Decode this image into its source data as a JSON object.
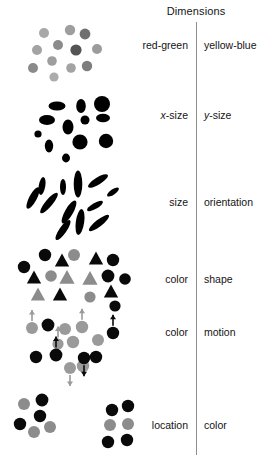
{
  "figure": {
    "title": "Dimensions",
    "width": 264,
    "height": 468,
    "background": "#ffffff",
    "divider_color": "#8f8f8f",
    "text_color": "#141414"
  },
  "rows": [
    {
      "id": "row-color-opponent",
      "left_label": "red-green",
      "right_label": "yellow-blue",
      "label_y": 39,
      "stimulus": "gray-circles-varying-lightness",
      "colors_used": [
        "#9a9a9a",
        "#b4b4b4",
        "#808080",
        "#6e6e6e",
        "#c3c3c3"
      ]
    },
    {
      "id": "row-size-xy",
      "left_label": "x-size",
      "right_label": "y-size",
      "left_label_italic_prefix": "x",
      "right_label_italic_prefix": "y",
      "label_y": 109,
      "stimulus": "black-ellipses-varying-width-height",
      "colors_used": [
        "#000000"
      ]
    },
    {
      "id": "row-size-orientation",
      "left_label": "size",
      "right_label": "orientation",
      "label_y": 196,
      "stimulus": "black-elongated-ellipses-varying-angle",
      "colors_used": [
        "#000000"
      ]
    },
    {
      "id": "row-color-shape",
      "left_label": "color",
      "right_label": "shape",
      "label_y": 273,
      "stimulus": "black-and-gray-circles-and-triangles",
      "colors_used": [
        "#0a0a0a",
        "#8c8c8c"
      ]
    },
    {
      "id": "row-color-motion",
      "left_label": "color",
      "right_label": "motion",
      "label_y": 326,
      "stimulus": "black-and-gray-circles-with-motion-arrows",
      "colors_used": [
        "#0a0a0a",
        "#9a9a9a"
      ]
    },
    {
      "id": "row-location-color",
      "left_label": "location",
      "right_label": "color",
      "label_y": 419,
      "stimulus": "two-clusters-of-black-and-gray-circles",
      "colors_used": [
        "#0a0a0a",
        "#8c8c8c"
      ]
    }
  ],
  "chart_data": {
    "type": "scatter",
    "title": "Dimensions",
    "xlabel": "",
    "ylabel": "",
    "panels": [
      {
        "name": "red-green / yellow-blue",
        "encoding": [
          "color-lightness"
        ],
        "marks": [
          {
            "shape": "circle",
            "x": 44,
            "y": 33,
            "r": 5.0,
            "fill": "#a8a8a8"
          },
          {
            "shape": "circle",
            "x": 70,
            "y": 30,
            "r": 5.2,
            "fill": "#9e9e9e"
          },
          {
            "shape": "circle",
            "x": 85,
            "y": 34,
            "r": 5.4,
            "fill": "#6f6f6f"
          },
          {
            "shape": "circle",
            "x": 58,
            "y": 45,
            "r": 5.0,
            "fill": "#8b8b8b"
          },
          {
            "shape": "circle",
            "x": 37,
            "y": 50,
            "r": 5.0,
            "fill": "#a3a3a3"
          },
          {
            "shape": "circle",
            "x": 76,
            "y": 50,
            "r": 5.6,
            "fill": "#545454"
          },
          {
            "shape": "circle",
            "x": 97,
            "y": 49,
            "r": 5.0,
            "fill": "#9b9b9b"
          },
          {
            "shape": "circle",
            "x": 52,
            "y": 61,
            "r": 4.8,
            "fill": "#9e9e9e"
          },
          {
            "shape": "circle",
            "x": 33,
            "y": 68,
            "r": 5.0,
            "fill": "#8a8a8a"
          },
          {
            "shape": "circle",
            "x": 71,
            "y": 68,
            "r": 4.8,
            "fill": "#a3a3a3"
          },
          {
            "shape": "circle",
            "x": 87,
            "y": 66,
            "r": 5.2,
            "fill": "#7d7d7d"
          },
          {
            "shape": "circle",
            "x": 54,
            "y": 77,
            "r": 4.6,
            "fill": "#acacac"
          }
        ]
      },
      {
        "name": "x-size / y-size",
        "encoding": [
          "width",
          "height"
        ],
        "marks": [
          {
            "shape": "ellipse",
            "x": 57,
            "y": 106,
            "rx": 8.5,
            "ry": 4.5,
            "fill": "#000000"
          },
          {
            "shape": "ellipse",
            "x": 81,
            "y": 106,
            "rx": 4.8,
            "ry": 7.0,
            "fill": "#000000"
          },
          {
            "shape": "ellipse",
            "x": 102,
            "y": 104,
            "rx": 8.0,
            "ry": 8.0,
            "fill": "#000000"
          },
          {
            "shape": "ellipse",
            "x": 47,
            "y": 120,
            "rx": 8.0,
            "ry": 5.0,
            "fill": "#000000"
          },
          {
            "shape": "ellipse",
            "x": 68,
            "y": 127,
            "rx": 5.5,
            "ry": 7.5,
            "fill": "#000000"
          },
          {
            "shape": "ellipse",
            "x": 85,
            "y": 120,
            "rx": 4.5,
            "ry": 4.5,
            "fill": "#000000"
          },
          {
            "shape": "ellipse",
            "x": 103,
            "y": 118,
            "rx": 7.0,
            "ry": 4.2,
            "fill": "#000000"
          },
          {
            "shape": "ellipse",
            "x": 38,
            "y": 134,
            "rx": 3.6,
            "ry": 3.6,
            "fill": "#000000"
          },
          {
            "shape": "ellipse",
            "x": 49,
            "y": 146,
            "rx": 4.2,
            "ry": 6.5,
            "fill": "#000000"
          },
          {
            "shape": "ellipse",
            "x": 80,
            "y": 142,
            "rx": 7.6,
            "ry": 7.6,
            "fill": "#000000"
          },
          {
            "shape": "ellipse",
            "x": 106,
            "y": 141,
            "rx": 7.2,
            "ry": 7.2,
            "fill": "#000000"
          },
          {
            "shape": "ellipse",
            "x": 66,
            "y": 158,
            "rx": 4.0,
            "ry": 4.4,
            "fill": "#000000"
          }
        ]
      },
      {
        "name": "size / orientation",
        "encoding": [
          "size",
          "angle"
        ],
        "marks": [
          {
            "shape": "ellipse",
            "x": 42,
            "y": 186,
            "rx": 3.3,
            "ry": 9.0,
            "angle": 10,
            "fill": "#000000"
          },
          {
            "shape": "ellipse",
            "x": 63,
            "y": 187,
            "rx": 3.0,
            "ry": 8.0,
            "angle": 0,
            "fill": "#000000"
          },
          {
            "shape": "ellipse",
            "x": 78,
            "y": 184,
            "rx": 4.3,
            "ry": 13.5,
            "angle": 0,
            "fill": "#000000"
          },
          {
            "shape": "ellipse",
            "x": 98,
            "y": 181,
            "rx": 3.6,
            "ry": 11.5,
            "angle": 58,
            "fill": "#000000"
          },
          {
            "shape": "ellipse",
            "x": 33,
            "y": 198,
            "rx": 3.8,
            "ry": 12.0,
            "angle": 28,
            "fill": "#000000"
          },
          {
            "shape": "ellipse",
            "x": 49,
            "y": 203,
            "rx": 3.6,
            "ry": 13.0,
            "angle": 40,
            "fill": "#000000"
          },
          {
            "shape": "ellipse",
            "x": 113,
            "y": 192,
            "rx": 2.6,
            "ry": 7.0,
            "angle": 55,
            "fill": "#000000"
          },
          {
            "shape": "ellipse",
            "x": 69,
            "y": 212,
            "rx": 4.0,
            "ry": 13.0,
            "angle": 30,
            "fill": "#000000"
          },
          {
            "shape": "ellipse",
            "x": 95,
            "y": 206,
            "rx": 3.0,
            "ry": 9.0,
            "angle": 60,
            "fill": "#000000"
          },
          {
            "shape": "ellipse",
            "x": 80,
            "y": 222,
            "rx": 4.2,
            "ry": 13.0,
            "angle": 8,
            "fill": "#000000"
          },
          {
            "shape": "ellipse",
            "x": 63,
            "y": 230,
            "rx": 3.6,
            "ry": 12.0,
            "angle": 35,
            "fill": "#000000"
          },
          {
            "shape": "ellipse",
            "x": 99,
            "y": 223,
            "rx": 3.4,
            "ry": 12.5,
            "angle": 52,
            "fill": "#000000"
          }
        ]
      },
      {
        "name": "color / shape",
        "encoding": [
          "color",
          "shape"
        ],
        "marks": [
          {
            "shape": "circle",
            "x": 45,
            "y": 255,
            "r": 6.2,
            "fill": "#0a0a0a"
          },
          {
            "shape": "circle",
            "x": 74,
            "y": 255,
            "r": 6.0,
            "fill": "#8c8c8c"
          },
          {
            "shape": "triangle",
            "x": 62,
            "y": 261,
            "s": 7.5,
            "fill": "#0a0a0a"
          },
          {
            "shape": "triangle",
            "x": 96,
            "y": 259,
            "s": 7.5,
            "fill": "#0a0a0a"
          },
          {
            "shape": "circle",
            "x": 113,
            "y": 260,
            "r": 6.2,
            "fill": "#0a0a0a"
          },
          {
            "shape": "circle",
            "x": 24,
            "y": 267,
            "r": 6.2,
            "fill": "#0a0a0a"
          },
          {
            "shape": "triangle",
            "x": 34,
            "y": 278,
            "s": 7.5,
            "fill": "#0a0a0a"
          },
          {
            "shape": "circle",
            "x": 51,
            "y": 276,
            "r": 5.8,
            "fill": "#8c8c8c"
          },
          {
            "shape": "triangle",
            "x": 67,
            "y": 278,
            "s": 8.0,
            "fill": "#8c8c8c"
          },
          {
            "shape": "triangle",
            "x": 90,
            "y": 279,
            "s": 8.0,
            "fill": "#8c8c8c"
          },
          {
            "shape": "circle",
            "x": 108,
            "y": 276,
            "r": 6.4,
            "fill": "#0a0a0a"
          },
          {
            "shape": "circle",
            "x": 125,
            "y": 279,
            "r": 5.8,
            "fill": "#0a0a0a"
          },
          {
            "shape": "triangle",
            "x": 38,
            "y": 295,
            "s": 7.5,
            "fill": "#8c8c8c"
          },
          {
            "shape": "triangle",
            "x": 60,
            "y": 295,
            "s": 7.5,
            "fill": "#0a0a0a"
          },
          {
            "shape": "triangle",
            "x": 111,
            "y": 292,
            "s": 7.5,
            "fill": "#0a0a0a"
          },
          {
            "shape": "circle",
            "x": 90,
            "y": 297,
            "r": 5.6,
            "fill": "#8c8c8c"
          },
          {
            "shape": "circle",
            "x": 115,
            "y": 306,
            "r": 5.6,
            "fill": "#0a0a0a"
          }
        ]
      },
      {
        "name": "color / motion",
        "encoding": [
          "color",
          "motion-direction"
        ],
        "marks": [
          {
            "shape": "circle",
            "x": 32,
            "y": 328,
            "r": 6.0,
            "fill": "#9a9a9a",
            "arrow": "up"
          },
          {
            "shape": "circle",
            "x": 48,
            "y": 325,
            "r": 6.4,
            "fill": "#0a0a0a",
            "arrow": "none"
          },
          {
            "shape": "circle",
            "x": 65,
            "y": 329,
            "r": 6.0,
            "fill": "#9a9a9a",
            "arrow": "none"
          },
          {
            "shape": "circle",
            "x": 82,
            "y": 327,
            "r": 6.2,
            "fill": "#9a9a9a",
            "arrow": "up"
          },
          {
            "shape": "circle",
            "x": 113,
            "y": 333,
            "r": 6.2,
            "fill": "#0a0a0a",
            "arrow": "up"
          },
          {
            "shape": "circle",
            "x": 58,
            "y": 344,
            "r": 5.6,
            "fill": "#9a9a9a",
            "arrow": "up"
          },
          {
            "shape": "circle",
            "x": 73,
            "y": 342,
            "r": 6.2,
            "fill": "#9a9a9a",
            "arrow": "none"
          },
          {
            "shape": "circle",
            "x": 98,
            "y": 340,
            "r": 6.0,
            "fill": "#9a9a9a",
            "arrow": "none"
          },
          {
            "shape": "circle",
            "x": 36,
            "y": 357,
            "r": 6.2,
            "fill": "#0a0a0a",
            "arrow": "none"
          },
          {
            "shape": "circle",
            "x": 56,
            "y": 355,
            "r": 6.4,
            "fill": "#0a0a0a",
            "arrow": "up"
          },
          {
            "shape": "circle",
            "x": 96,
            "y": 357,
            "r": 6.2,
            "fill": "#0a0a0a",
            "arrow": "none"
          },
          {
            "shape": "circle",
            "x": 70,
            "y": 368,
            "r": 6.0,
            "fill": "#9a9a9a",
            "arrow": "down"
          },
          {
            "shape": "circle",
            "x": 83,
            "y": 366,
            "r": 6.2,
            "fill": "#9a9a9a",
            "arrow": "none"
          },
          {
            "shape": "circle",
            "x": 84,
            "y": 358,
            "r": 6.2,
            "fill": "#0a0a0a",
            "arrow": "down"
          }
        ]
      },
      {
        "name": "location / color",
        "encoding": [
          "position-cluster",
          "color"
        ],
        "marks": [
          {
            "shape": "circle",
            "x": 24,
            "y": 404,
            "r": 6.0,
            "fill": "#8c8c8c"
          },
          {
            "shape": "circle",
            "x": 42,
            "y": 400,
            "r": 6.4,
            "fill": "#0a0a0a"
          },
          {
            "shape": "circle",
            "x": 40,
            "y": 416,
            "r": 6.2,
            "fill": "#0a0a0a"
          },
          {
            "shape": "circle",
            "x": 20,
            "y": 424,
            "r": 6.2,
            "fill": "#0a0a0a"
          },
          {
            "shape": "circle",
            "x": 34,
            "y": 432,
            "r": 6.0,
            "fill": "#8c8c8c"
          },
          {
            "shape": "circle",
            "x": 50,
            "y": 427,
            "r": 6.0,
            "fill": "#8c8c8c"
          },
          {
            "shape": "circle",
            "x": 112,
            "y": 410,
            "r": 6.2,
            "fill": "#0a0a0a"
          },
          {
            "shape": "circle",
            "x": 128,
            "y": 406,
            "r": 6.2,
            "fill": "#0a0a0a"
          },
          {
            "shape": "circle",
            "x": 110,
            "y": 425,
            "r": 6.0,
            "fill": "#8c8c8c"
          },
          {
            "shape": "circle",
            "x": 128,
            "y": 424,
            "r": 6.0,
            "fill": "#8c8c8c"
          },
          {
            "shape": "circle",
            "x": 108,
            "y": 442,
            "r": 6.2,
            "fill": "#0a0a0a"
          },
          {
            "shape": "circle",
            "x": 127,
            "y": 440,
            "r": 6.2,
            "fill": "#0a0a0a"
          }
        ]
      }
    ]
  }
}
